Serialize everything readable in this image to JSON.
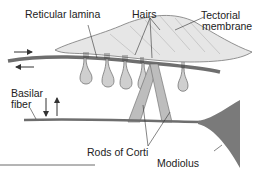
{
  "labels": {
    "reticular_lamina": "Reticular lamina",
    "hairs": "Hairs",
    "tectorial_membrane_1": "Tectorial",
    "tectorial_membrane_2": "membrane",
    "basilar_fiber_1": "Basilar",
    "basilar_fiber_2": "fiber",
    "rods_of_corti": "Rods of Corti",
    "modiolus": "Modiolus"
  },
  "colors": {
    "tectorial_fill": "#e6e6e6",
    "cell_fill": "#cfcfcf",
    "lamina": "#6e6e6e",
    "modiolus": "#7a7a7a",
    "line": "#333333"
  }
}
